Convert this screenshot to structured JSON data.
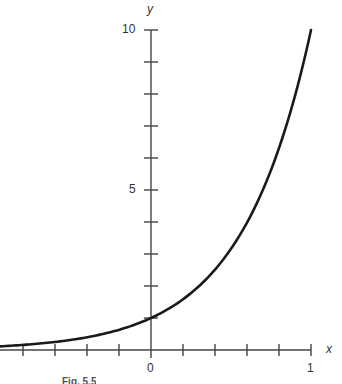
{
  "chart_data": {
    "type": "line",
    "title": "",
    "function": "y = 10^x",
    "xlabel": "x",
    "ylabel": "y",
    "xlim": [
      -0.94,
      1
    ],
    "ylim": [
      0,
      10
    ],
    "x_ticks": [
      -0.8,
      -0.6,
      -0.4,
      -0.2,
      0,
      0.2,
      0.4,
      0.6,
      0.8,
      1
    ],
    "x_tick_labels": {
      "0": "0",
      "1": "1"
    },
    "y_ticks": [
      1,
      2,
      3,
      4,
      5,
      6,
      7,
      8,
      9,
      10
    ],
    "y_tick_labels": {
      "5": "5",
      "10": "10"
    },
    "grid": false,
    "series": [
      {
        "name": "10^x",
        "x": [
          -0.94,
          -0.8,
          -0.6,
          -0.4,
          -0.2,
          0,
          0.2,
          0.4,
          0.6,
          0.8,
          1
        ],
        "values": [
          0.11,
          0.16,
          0.25,
          0.4,
          0.63,
          1.0,
          1.58,
          2.51,
          3.98,
          6.31,
          10.0
        ]
      }
    ]
  },
  "labels": {
    "x_axis": "x",
    "y_axis": "y",
    "x_zero": "0",
    "x_one": "1",
    "y_five": "5",
    "y_ten": "10",
    "caption": "Fig. 5.5"
  }
}
